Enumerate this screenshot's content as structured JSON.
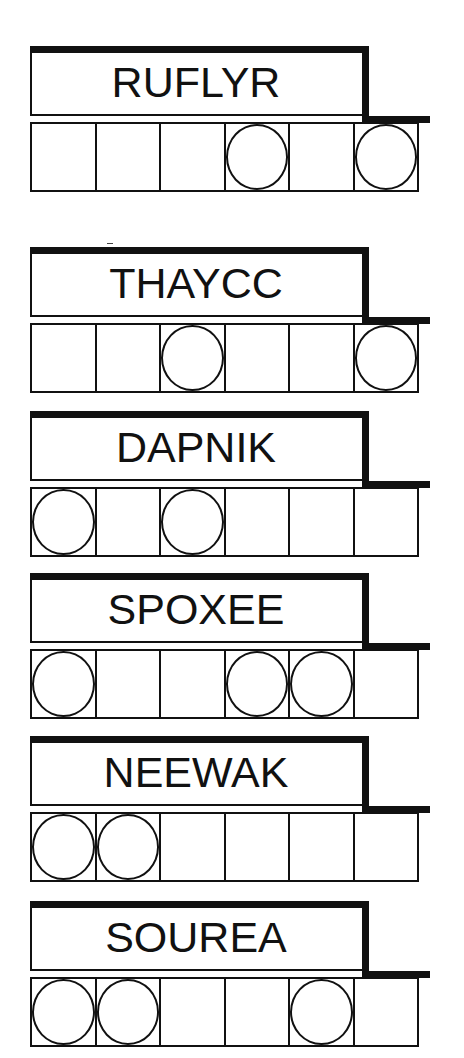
{
  "puzzles": [
    {
      "word": "RUFLYR",
      "letters": 6,
      "circled": [
        false,
        false,
        false,
        true,
        false,
        true
      ]
    },
    {
      "word": "THAYCC",
      "letters": 6,
      "circled": [
        false,
        false,
        true,
        false,
        false,
        true
      ]
    },
    {
      "word": "DAPNIK",
      "letters": 6,
      "circled": [
        true,
        false,
        true,
        false,
        false,
        false
      ]
    },
    {
      "word": "SPOXEE",
      "letters": 6,
      "circled": [
        true,
        false,
        false,
        true,
        true,
        false
      ]
    },
    {
      "word": "NEEWAK",
      "letters": 6,
      "circled": [
        true,
        true,
        false,
        false,
        false,
        false
      ]
    },
    {
      "word": "SOUREA",
      "letters": 6,
      "circled": [
        true,
        true,
        false,
        false,
        true,
        false
      ]
    }
  ],
  "colors": {
    "ink": "#111111",
    "background": "#ffffff"
  }
}
